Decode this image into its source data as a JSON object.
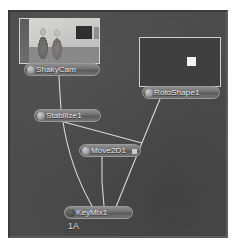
{
  "app": {
    "view_name": "Node Graph",
    "canvas_bg_color": "#4b4b4b",
    "wire_color": "#d8d8d8"
  },
  "thumbnails": [
    {
      "id": "shakycam-thumbnail",
      "for_node": "ShakyCam",
      "description": "grayscale footage of two people standing in a room with framed pictures on the wall"
    },
    {
      "id": "rotoshape-thumbnail",
      "for_node": "RotoShape1",
      "description": "black frame containing a single small white square matte"
    }
  ],
  "nodes": [
    {
      "id": "shakycam",
      "label": "ShakyCam",
      "type": "image-source"
    },
    {
      "id": "rotoshape",
      "label": "RotoShape1",
      "type": "roto"
    },
    {
      "id": "stabilize",
      "label": "Stabilize1",
      "type": "tracker"
    },
    {
      "id": "move2d",
      "label": "Move2D1",
      "type": "transform"
    },
    {
      "id": "keymix",
      "label": "KeyMix1",
      "type": "composite"
    }
  ],
  "connections": [
    {
      "from": "ShakyCam",
      "to": "Stabilize1"
    },
    {
      "from": "Stabilize1",
      "to": "Move2D1"
    },
    {
      "from": "Stabilize1",
      "to": "KeyMix1"
    },
    {
      "from": "Move2D1",
      "to": "KeyMix1"
    },
    {
      "from": "RotoShape1",
      "to": "KeyMix1"
    }
  ],
  "footer": {
    "view_id": "1A"
  }
}
